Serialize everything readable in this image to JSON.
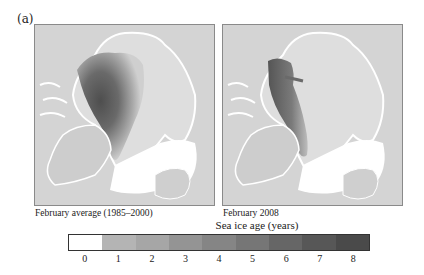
{
  "figure": {
    "panel_label": "(a)",
    "maps": [
      {
        "caption": "February average (1985–2000)",
        "period": "1985-2000 average"
      },
      {
        "caption": "February 2008",
        "period": "2008"
      }
    ],
    "colorbar": {
      "title": "Sea ice age (years)",
      "ticks": [
        "0",
        "1",
        "2",
        "3",
        "4",
        "5",
        "6",
        "7",
        "8"
      ],
      "colors": [
        "#ffffff",
        "#b4b4b4",
        "#a6a6a6",
        "#949494",
        "#858585",
        "#767676",
        "#666666",
        "#575757",
        "#4a4a4a"
      ]
    },
    "colors": {
      "land": "#d4d4d4",
      "coast_ice_edge": "#ffffff",
      "young_ice": "#dcdcdc",
      "old_ice": "#4a4a4a"
    }
  }
}
